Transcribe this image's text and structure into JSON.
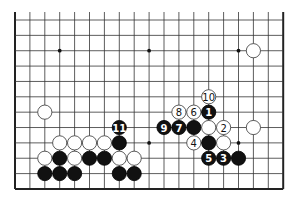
{
  "diagram": {
    "board": {
      "columns": 19,
      "rows_visible": 12,
      "origin_x": 15,
      "origin_y": 20,
      "spacing_x": 14.9,
      "spacing_y": 15.36,
      "top_open": true,
      "colors": {
        "line": "#333333",
        "black": "#111111",
        "white": "#ffffff",
        "background": "#ffffff"
      }
    },
    "star_points": [
      {
        "col": 3,
        "row": 2
      },
      {
        "col": 9,
        "row": 2
      },
      {
        "col": 15,
        "row": 2
      },
      {
        "col": 3,
        "row": 8
      },
      {
        "col": 9,
        "row": 8
      },
      {
        "col": 15,
        "row": 8
      }
    ],
    "stones": [
      {
        "col": 16,
        "row": 2,
        "color": "white",
        "label": ""
      },
      {
        "col": 2,
        "row": 6,
        "color": "white",
        "label": ""
      },
      {
        "col": 13,
        "row": 5,
        "color": "white",
        "label": "10"
      },
      {
        "col": 11,
        "row": 6,
        "color": "white",
        "label": "8"
      },
      {
        "col": 12,
        "row": 6,
        "color": "white",
        "label": "6"
      },
      {
        "col": 13,
        "row": 6,
        "color": "black",
        "label": "1"
      },
      {
        "col": 10,
        "row": 7,
        "color": "black",
        "label": "9"
      },
      {
        "col": 11,
        "row": 7,
        "color": "black",
        "label": "7"
      },
      {
        "col": 12,
        "row": 7,
        "color": "black",
        "label": ""
      },
      {
        "col": 13,
        "row": 7,
        "color": "white",
        "label": ""
      },
      {
        "col": 14,
        "row": 7,
        "color": "white",
        "label": "2"
      },
      {
        "col": 16,
        "row": 7,
        "color": "white",
        "label": ""
      },
      {
        "col": 12,
        "row": 8,
        "color": "white",
        "label": "4"
      },
      {
        "col": 13,
        "row": 8,
        "color": "black",
        "label": ""
      },
      {
        "col": 14,
        "row": 8,
        "color": "white",
        "label": ""
      },
      {
        "col": 13,
        "row": 9,
        "color": "black",
        "label": "5"
      },
      {
        "col": 14,
        "row": 9,
        "color": "black",
        "label": "3"
      },
      {
        "col": 15,
        "row": 9,
        "color": "black",
        "label": ""
      },
      {
        "col": 7,
        "row": 7,
        "color": "black",
        "label": "11"
      },
      {
        "col": 3,
        "row": 8,
        "color": "white",
        "label": ""
      },
      {
        "col": 4,
        "row": 8,
        "color": "white",
        "label": ""
      },
      {
        "col": 5,
        "row": 8,
        "color": "white",
        "label": ""
      },
      {
        "col": 6,
        "row": 8,
        "color": "white",
        "label": ""
      },
      {
        "col": 7,
        "row": 8,
        "color": "black",
        "label": ""
      },
      {
        "col": 2,
        "row": 9,
        "color": "white",
        "label": ""
      },
      {
        "col": 3,
        "row": 9,
        "color": "black",
        "label": ""
      },
      {
        "col": 4,
        "row": 9,
        "color": "white",
        "label": ""
      },
      {
        "col": 5,
        "row": 9,
        "color": "black",
        "label": ""
      },
      {
        "col": 6,
        "row": 9,
        "color": "black",
        "label": ""
      },
      {
        "col": 7,
        "row": 9,
        "color": "white",
        "label": ""
      },
      {
        "col": 8,
        "row": 9,
        "color": "white",
        "label": ""
      },
      {
        "col": 2,
        "row": 10,
        "color": "black",
        "label": ""
      },
      {
        "col": 3,
        "row": 10,
        "color": "black",
        "label": ""
      },
      {
        "col": 4,
        "row": 10,
        "color": "black",
        "label": ""
      },
      {
        "col": 7,
        "row": 10,
        "color": "black",
        "label": ""
      },
      {
        "col": 8,
        "row": 10,
        "color": "black",
        "label": ""
      }
    ]
  }
}
